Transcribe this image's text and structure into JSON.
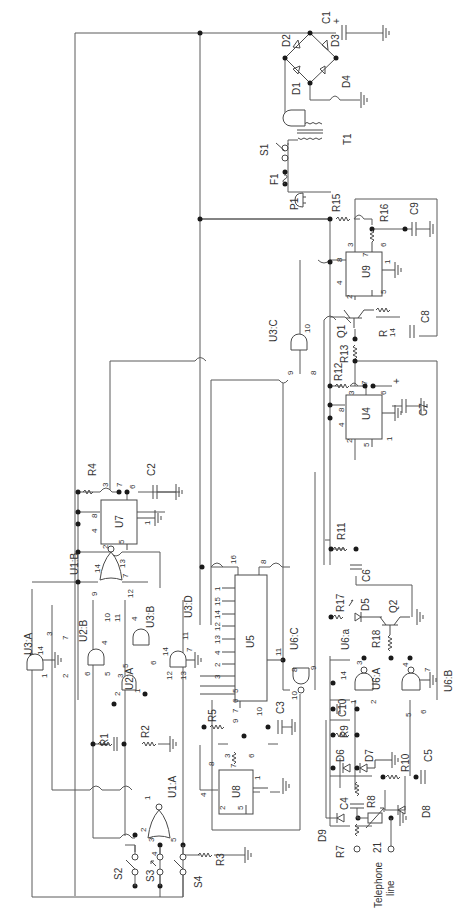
{
  "diagram": {
    "type": "circuit-schematic",
    "orientation": "rotated-90-ccw",
    "colors": {
      "wire": "#5a5a5a",
      "text": "#333333",
      "junction": "#1a1a1a",
      "background": "#ffffff"
    },
    "labels": {
      "C1": "C1",
      "C1_plus": "+",
      "D1": "D1",
      "D2": "D2",
      "D3": "D3",
      "D4": "D4",
      "T1": "T1",
      "S1": "S1",
      "F1": "F1",
      "P1": "P1",
      "R15": "R15",
      "R16": "R16",
      "C9": "C9",
      "U9": "U9",
      "C8": "C8",
      "Q1": "Q1",
      "R14": "R\n14",
      "R14a": "R",
      "R14b": "14",
      "R13": "R13",
      "R12": "R12",
      "U3C": "U3:C",
      "U4": "U4",
      "C7": "C7",
      "C7_plus": "+",
      "R4": "R4",
      "C2": "C2",
      "U7": "U7",
      "U1B": "U1:B",
      "U3A": "U3:A",
      "U2B": "U2:B",
      "U2A": "U2:A",
      "U3B": "U3:B",
      "U3D": "U3:D",
      "U5": "U5",
      "U6C": "U6:C",
      "R11": "R11",
      "C6": "C6",
      "R17": "R17",
      "D5": "D5",
      "Q2": "Q2",
      "R18": "R18",
      "U6a": "U6:a",
      "U6A": "U6:A",
      "U6B": "U6:B",
      "C10": "C10",
      "R9": "R9",
      "D6": "D6",
      "D7": "D7",
      "R10": "R10",
      "C5": "C5",
      "D8": "D8",
      "R8": "R8",
      "C4": "C4",
      "D9": "D9",
      "R7": "R7",
      "Z1": "21",
      "R1": "R1",
      "R2": "R2",
      "R3": "R3",
      "R5": "R5",
      "C3": "C3",
      "U8": "U8",
      "U1A": "U1:A",
      "S2": "S2",
      "S3": "S3",
      "S4": "S4",
      "telephone_line_1": "Telephone",
      "telephone_line_2": "line"
    },
    "pins": {
      "U9": {
        "p3": "3",
        "p7": "7",
        "p6": "6",
        "p8": "8",
        "p4": "4",
        "p1": "1",
        "p2": "2",
        "p5": "5"
      },
      "U3C": {
        "p10": "10",
        "p9": "9",
        "p8": "8"
      },
      "U4": {
        "p3": "3",
        "p7": "7",
        "p6": "6",
        "p8": "8",
        "p4": "4",
        "p2": "2",
        "p5": "5",
        "p1": "1"
      },
      "U7": {
        "p3": "3",
        "p7": "7",
        "p6": "6",
        "p8": "8",
        "p4": "4",
        "p2": "2",
        "p5": "5",
        "p1": "1"
      },
      "U1B": {
        "p13": "13",
        "p14": "14",
        "p7": "7",
        "p9": "9",
        "p12": "12",
        "p10": "10",
        "p11": "11"
      },
      "U3A": {
        "p3": "3",
        "p14": "14",
        "p7": "7",
        "p1": "1",
        "p2": "2"
      },
      "U2B": {
        "p4": "4",
        "p6": "6",
        "p5": "5"
      },
      "U2A": {
        "p3": "3",
        "p2": "2",
        "p1": "1"
      },
      "U3B": {
        "p4": "4",
        "p5": "5",
        "p6": "6"
      },
      "U3D": {
        "p11": "11",
        "p14": "14",
        "p7": "7",
        "p12": "12",
        "p13": "13"
      },
      "U5": {
        "p16": "16",
        "p8": "8",
        "p1": "1",
        "p15": "15",
        "p14": "14",
        "p12": "12",
        "p13": "13",
        "p4": "4",
        "p2": "2",
        "p3": "3",
        "p5": "5",
        "p6": "6",
        "p7": "7",
        "p9": "9",
        "p10": "10",
        "p11": "11"
      },
      "U6C": {
        "p8": "8",
        "p9": "9",
        "p10": "10"
      },
      "U6A": {
        "p3": "3",
        "p14": "14",
        "p2": "2",
        "p1": "1"
      },
      "U6B": {
        "p4": "4",
        "p7": "7",
        "p5": "5",
        "p6": "6"
      },
      "U8": {
        "p8": "8",
        "p3": "3",
        "p7": "7",
        "p6": "6",
        "p1": "1",
        "p4": "4",
        "p2": "2",
        "p5": "5"
      },
      "U1A": {
        "p1": "1",
        "p2": "2",
        "p3": "3",
        "p4": "4",
        "p5": "5"
      }
    }
  }
}
